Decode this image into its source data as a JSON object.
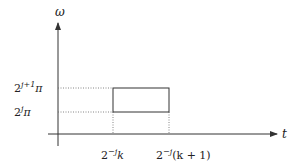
{
  "diagram": {
    "type": "time-frequency tile",
    "axes": {
      "x_label": "t",
      "y_label": "ω"
    },
    "y_ticks": [
      {
        "base": "2",
        "exp": "j+1",
        "suffix": "π"
      },
      {
        "base": "2",
        "exp": "j",
        "suffix": "π"
      }
    ],
    "x_ticks": [
      {
        "base": "2",
        "exp": "−j",
        "suffix": "k"
      },
      {
        "base": "2",
        "exp": "−j",
        "suffix": "(k + 1)"
      }
    ],
    "colors": {
      "axis": "#333333",
      "box": "#333333",
      "guide": "#666666"
    }
  }
}
